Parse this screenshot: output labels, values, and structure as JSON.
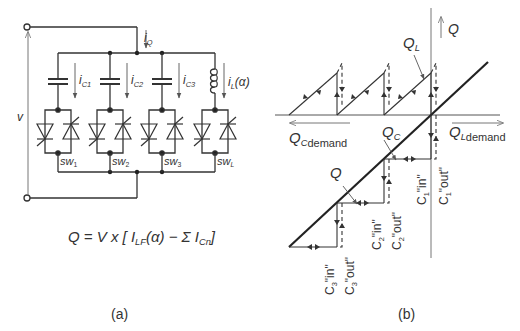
{
  "panel_a": {
    "caption": "(a)",
    "voltage_label": "v",
    "current_total": {
      "main": "i",
      "sub": "Q"
    },
    "branches": [
      {
        "current": {
          "main": "i",
          "sub": "C1"
        },
        "element": "capacitor",
        "switch": {
          "main": "sw",
          "sub": "1"
        }
      },
      {
        "current": {
          "main": "i",
          "sub": "C2"
        },
        "element": "capacitor",
        "switch": {
          "main": "sw",
          "sub": "2"
        }
      },
      {
        "current": {
          "main": "i",
          "sub": "C3"
        },
        "element": "capacitor",
        "switch": {
          "main": "sw",
          "sub": "3"
        }
      },
      {
        "current": {
          "main": "i",
          "sub": "L",
          "suffix": "(α)"
        },
        "element": "inductor",
        "switch": {
          "main": "sw",
          "sub": "L"
        }
      }
    ],
    "formula": {
      "lhs": "Q = V x [ ",
      "i1": "I",
      "i1_sub": "LF",
      "mid": "(α) − Σ ",
      "i2": "I",
      "i2_sub": "Cn",
      "end": "]"
    }
  },
  "panel_b": {
    "caption": "(b)",
    "axis_q": "Q",
    "q_l": {
      "main": "Q",
      "sub": "L"
    },
    "q_c": {
      "main": "Q",
      "sub": "C"
    },
    "q_line": "Q",
    "qc_demand": {
      "main": "Q",
      "sub1": "C",
      "sub2": "demand"
    },
    "ql_demand": {
      "main": "Q",
      "sub1": "L",
      "sub2": "demand"
    },
    "switch_labels": [
      {
        "cap": "C",
        "n": "1",
        "state": "\"in\""
      },
      {
        "cap": "C",
        "n": "1",
        "state": "\"out\""
      },
      {
        "cap": "C",
        "n": "2",
        "state": "\"in\""
      },
      {
        "cap": "C",
        "n": "2",
        "state": "\"out\""
      },
      {
        "cap": "C",
        "n": "3",
        "state": "\"in\""
      },
      {
        "cap": "C",
        "n": "3",
        "state": "\"out\""
      }
    ]
  }
}
